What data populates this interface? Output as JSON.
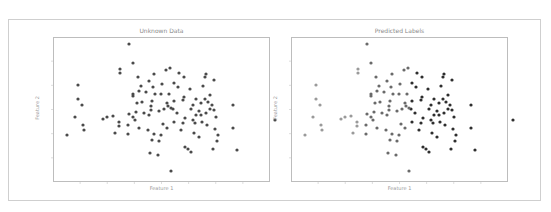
{
  "chart_data": [
    {
      "type": "scatter",
      "title": "Unknown Data",
      "xlabel": "Feature 1",
      "ylabel": "Feature 2",
      "grid": false,
      "legend": null,
      "tick_labels_visible": false,
      "point_color": "#4a4a4a",
      "points_px": [
        [
          76,
          7
        ],
        [
          80,
          26
        ],
        [
          67,
          32
        ],
        [
          67,
          36
        ],
        [
          25,
          48
        ],
        [
          25,
          62
        ],
        [
          29,
          68
        ],
        [
          22,
          80
        ],
        [
          30,
          88
        ],
        [
          31,
          93
        ],
        [
          14,
          98
        ],
        [
          85,
          40
        ],
        [
          101,
          37
        ],
        [
          96,
          44
        ],
        [
          113,
          33
        ],
        [
          109,
          47
        ],
        [
          100,
          50
        ],
        [
          86,
          54
        ],
        [
          80,
          57
        ],
        [
          80,
          59
        ],
        [
          93,
          55
        ],
        [
          117,
          31
        ],
        [
          121,
          46
        ],
        [
          116,
          57
        ],
        [
          108,
          57
        ],
        [
          121,
          64
        ],
        [
          131,
          40
        ],
        [
          137,
          52
        ],
        [
          114,
          66
        ],
        [
          115,
          69
        ],
        [
          120,
          72
        ],
        [
          111,
          72
        ],
        [
          118,
          71
        ],
        [
          106,
          74
        ],
        [
          131,
          60
        ],
        [
          143,
          62
        ],
        [
          140,
          68
        ],
        [
          138,
          72
        ],
        [
          143,
          78
        ],
        [
          146,
          74
        ],
        [
          140,
          83
        ],
        [
          132,
          81
        ],
        [
          152,
          40
        ],
        [
          153,
          37
        ],
        [
          150,
          49
        ],
        [
          161,
          43
        ],
        [
          152,
          62
        ],
        [
          155,
          65
        ],
        [
          159,
          68
        ],
        [
          157,
          72
        ],
        [
          163,
          80
        ],
        [
          161,
          73
        ],
        [
          153,
          76
        ],
        [
          148,
          78
        ],
        [
          149,
          85
        ],
        [
          154,
          88
        ],
        [
          162,
          92
        ],
        [
          165,
          98
        ],
        [
          84,
          66
        ],
        [
          83,
          75
        ],
        [
          76,
          77
        ],
        [
          80,
          80
        ],
        [
          82,
          83
        ],
        [
          75,
          88
        ],
        [
          89,
          65
        ],
        [
          99,
          64
        ],
        [
          98,
          69
        ],
        [
          98,
          73
        ],
        [
          91,
          76
        ],
        [
          96,
          78
        ],
        [
          86,
          91
        ],
        [
          95,
          93
        ],
        [
          101,
          97
        ],
        [
          99,
          103
        ],
        [
          108,
          98
        ],
        [
          106,
          104
        ],
        [
          110,
          87
        ],
        [
          114,
          91
        ],
        [
          121,
          85
        ],
        [
          130,
          86
        ],
        [
          141,
          96
        ],
        [
          146,
          100
        ],
        [
          132,
          110
        ],
        [
          135,
          112
        ],
        [
          138,
          115
        ],
        [
          160,
          112
        ],
        [
          180,
          91
        ],
        [
          180,
          68
        ],
        [
          184,
          113
        ],
        [
          97,
          116
        ],
        [
          118,
          134
        ],
        [
          164,
          104
        ],
        [
          50,
          82
        ],
        [
          54,
          80
        ],
        [
          60,
          79
        ],
        [
          66,
          85
        ],
        [
          66,
          89
        ],
        [
          75,
          97
        ],
        [
          62,
          96
        ],
        [
          105,
          118
        ],
        [
          222,
          83
        ],
        [
          88,
          49
        ],
        [
          125,
          50
        ],
        [
          130,
          63
        ],
        [
          124,
          76
        ],
        [
          128,
          93
        ],
        [
          142,
          86
        ],
        [
          148,
          66
        ],
        [
          157,
          58
        ],
        [
          126,
          36
        ],
        [
          102,
          57
        ]
      ]
    },
    {
      "type": "scatter",
      "title": "Predicted Labels",
      "xlabel": "Feature 1",
      "ylabel": "Feature 2",
      "grid": false,
      "legend": null,
      "tick_labels_visible": false,
      "color_encoding": "grayscale gradient by cluster: lighter gray on left side, darker gray/black on right side",
      "colors": {
        "light": "#9a9a9a",
        "mid": "#6a6a6a",
        "dark": "#2e2e2e"
      }
    }
  ],
  "panels": {
    "left": {
      "title": "Unknown Data",
      "xlabel": "Feature 1",
      "ylabel": "Feature 2"
    },
    "right": {
      "title": "Predicted Labels",
      "xlabel": "Feature 1",
      "ylabel": "Feature 2"
    }
  }
}
